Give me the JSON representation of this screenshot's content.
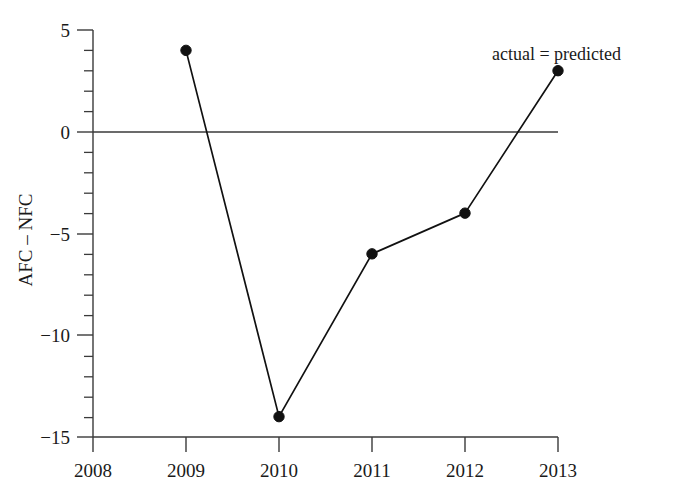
{
  "chart_data": {
    "type": "line",
    "title": "",
    "xlabel": "",
    "ylabel": "AFC – NFC",
    "x": [
      2009,
      2010,
      2011,
      2012,
      2013
    ],
    "values": [
      4,
      -14,
      -6,
      -4,
      3
    ],
    "series": [
      {
        "name": "AFC – NFC",
        "values": [
          4,
          -14,
          -6,
          -4,
          3
        ]
      }
    ],
    "xlim": [
      2008,
      2013
    ],
    "ylim": [
      -15,
      5
    ],
    "x_tick_labels": [
      "2008",
      "2009",
      "2010",
      "2011",
      "2012",
      "2013"
    ],
    "x_ticks": [
      2008,
      2009,
      2010,
      2011,
      2012,
      2013
    ],
    "y_tick_labels": [
      "5",
      "0",
      "−5",
      "−10",
      "−15"
    ],
    "y_ticks": [
      5,
      0,
      -5,
      -10,
      -15
    ],
    "y_minor_tick_step": 1,
    "grid": false,
    "legend": null,
    "reference_lines": [
      {
        "name": "zero-line",
        "orientation": "horizontal",
        "value": 0
      }
    ],
    "annotations": [
      {
        "text": "actual = predicted",
        "x": 2012.35,
        "y": 4.1
      }
    ],
    "marker": "circle",
    "marker_color": "#111111",
    "line_color": "#111111"
  },
  "axes": {
    "y_title": "AFC – NFC",
    "y_labels": {
      "t5": "5",
      "t0": "0",
      "tm5": "−5",
      "tm10": "−10",
      "tm15": "−15"
    },
    "x_labels": {
      "t2008": "2008",
      "t2009": "2009",
      "t2010": "2010",
      "t2011": "2011",
      "t2012": "2012",
      "t2013": "2013"
    }
  },
  "annotation": {
    "actual_predicted": "actual = predicted"
  }
}
